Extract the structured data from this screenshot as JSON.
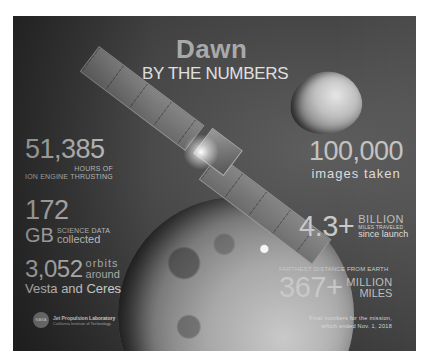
{
  "header": {
    "title": "Dawn",
    "subtitle": "BY THE NUMBERS"
  },
  "stats": {
    "ion_engine": {
      "value": "51,385",
      "line1": "HOURS OF",
      "line2": "ION ENGINE THRUSTING"
    },
    "science_data": {
      "value": "172",
      "unit": "GB",
      "line1": "SCIENCE DATA",
      "line2": "collected"
    },
    "orbits": {
      "value": "3,052",
      "line1": "orbits",
      "line2": "around",
      "line3": "Vesta and Ceres"
    },
    "images": {
      "value": "100,000",
      "label": "images taken"
    },
    "miles_traveled": {
      "value": "4.3+",
      "line1": "BILLION",
      "line2": "MILES TRAVELED",
      "line3": "since launch"
    },
    "farthest_distance": {
      "heading": "FARTHEST DISTANCE FROM EARTH",
      "value": "367+",
      "line1": "MILLION",
      "line2": "MILES"
    }
  },
  "footer": {
    "logo_text": "NASA",
    "org_line1": "Jet Propulsion Laboratory",
    "org_line2": "California Institute of Technology",
    "note_line1": "Final numbers for the mission,",
    "note_line2": "which ended Nov. 1, 2018"
  },
  "icons": {
    "spacecraft": "dawn-spacecraft-illustration",
    "asteroid_1": "vesta-asteroid",
    "asteroid_2": "ceres-dwarf-planet"
  }
}
